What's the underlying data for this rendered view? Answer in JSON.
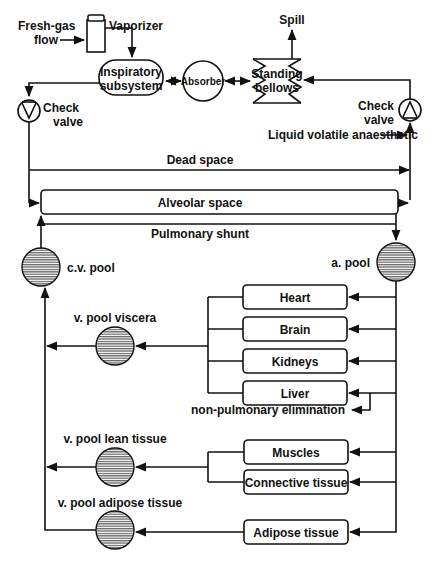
{
  "diagram": {
    "labels": {
      "fresh_gas_line1": "Fresh-gas",
      "fresh_gas_line2": "flow",
      "vaporizer": "Vaporizer",
      "spill": "Spill",
      "inspiratory_line1": "Inspiratory",
      "inspiratory_line2": "subsystem",
      "absorber": "Absorber",
      "bellows_line1": "Standing",
      "bellows_line2": "bellows",
      "check_valve_left_line1": "Check",
      "check_valve_left_line2": "valve",
      "check_valve_right_line1": "Check",
      "check_valve_right_line2": "valve",
      "liquid_volatile": "Liquid volatile anaesthetic",
      "dead_space": "Dead space",
      "alveolar_space": "Alveolar space",
      "pulmonary_shunt": "Pulmonary shunt",
      "cv_pool": "c.v. pool",
      "a_pool": "a. pool",
      "v_pool_viscera": "v. pool viscera",
      "v_pool_lean": "v. pool lean tissue",
      "v_pool_adipose": "v. pool adipose tissue",
      "non_pulmonary": "non-pulmonary elimination"
    },
    "organs": [
      {
        "id": "heart",
        "label": "Heart"
      },
      {
        "id": "brain",
        "label": "Brain"
      },
      {
        "id": "kidneys",
        "label": "Kidneys"
      },
      {
        "id": "liver",
        "label": "Liver"
      },
      {
        "id": "muscles",
        "label": "Muscles"
      },
      {
        "id": "connective",
        "label": "Connective tissue"
      },
      {
        "id": "adipose",
        "label": "Adipose tissue"
      }
    ],
    "colors": {
      "ink": "#111111",
      "background": "#ffffff",
      "pool_fill": "#9a9a9a"
    }
  }
}
